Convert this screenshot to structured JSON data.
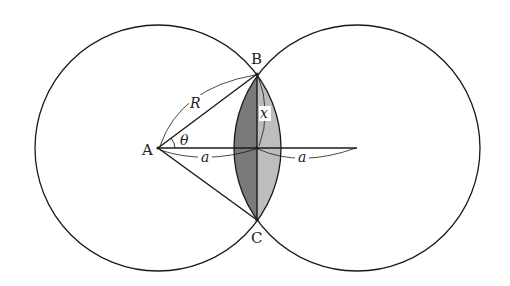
{
  "diagram": {
    "points": {
      "A": "A",
      "B": "B",
      "C": "C"
    },
    "labels": {
      "radius": "R",
      "angle": "θ",
      "half_chord": "x",
      "distance_left": "a",
      "distance_right": "a"
    },
    "colors": {
      "stroke": "#1a1a1a",
      "lens_left_fill": "#7a7a7a",
      "lens_right_fill": "#bdbdbd",
      "background": "#ffffff"
    }
  }
}
